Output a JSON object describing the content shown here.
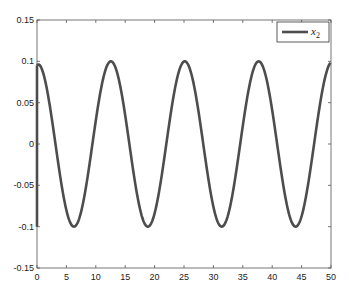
{
  "chart_data": {
    "type": "line",
    "title": "",
    "xlabel": "",
    "ylabel": "",
    "xlim": [
      0,
      50
    ],
    "ylim": [
      -0.15,
      0.15
    ],
    "xticks": [
      0,
      5,
      10,
      15,
      20,
      25,
      30,
      35,
      40,
      45,
      50
    ],
    "yticks": [
      -0.15,
      -0.1,
      -0.05,
      0,
      0.05,
      0.1,
      0.15
    ],
    "ytick_labels": [
      "-0.15",
      "-0.1",
      "-0.05",
      "0",
      "0.05",
      "0.1",
      "0.15"
    ],
    "grid": false,
    "legend": {
      "position": "upper right",
      "entries": [
        "x_2"
      ]
    },
    "series": [
      {
        "name": "x_2",
        "color": "#4d4d4d",
        "description": "sinusoid of amplitude ~0.1, period ~12.57 (4π); initial jump at t=0 from -0.1 to 0.095",
        "x": [
          0,
          0,
          3.14,
          6.28,
          9.42,
          12.57,
          15.71,
          18.85,
          21.99,
          25.13,
          28.27,
          31.42,
          34.56,
          37.7,
          40.84,
          43.98,
          47.12,
          50
        ],
        "values": [
          -0.1,
          0.095,
          0,
          -0.1,
          0,
          0.1,
          0,
          -0.1,
          0,
          0.1,
          0,
          -0.1,
          0,
          0.1,
          0,
          -0.1,
          0,
          0.099
        ]
      }
    ]
  },
  "legend_label": "x",
  "legend_sub": "2"
}
